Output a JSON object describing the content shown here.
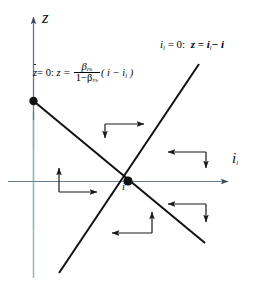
{
  "figure": {
    "type": "phase-plane-diagram",
    "background": "#ffffff"
  },
  "axes": {
    "vertical": {
      "label": "z",
      "name": "z-axis",
      "color_upper": "#c9525f",
      "color_lower": "#7fb0ad",
      "x": 33,
      "y_top": 12,
      "y_bottom": 278
    },
    "horizontal": {
      "label": "i",
      "label_subscript": "l",
      "name": "il-axis",
      "color": "#6e7f94",
      "y": 181,
      "x_left": 8,
      "x_right": 232
    }
  },
  "nullclines": [
    {
      "name": "zdot-nullcline",
      "slope": "negative",
      "label_prefix": "z",
      "label_prefix_condition": "= 0:",
      "label_lhs": "z =",
      "numerator": "β",
      "numerator_sub": "Pb",
      "denominator_lead": "1−β",
      "denominator_sub": "Pb",
      "factor": "( i − i",
      "factor_sub": "l",
      "factor_close": " )",
      "color": "#000000"
    },
    {
      "name": "ildot-nullcline",
      "slope": "positive",
      "label": "i",
      "label_sub": "l",
      "label_eq": "= 0:",
      "label_rhs_lead": "z = i",
      "label_rhs_sub": "l",
      "label_rhs_tail": "− i",
      "color": "#000000"
    }
  ],
  "points": [
    {
      "name": "equilibrium-point",
      "label": "i",
      "x": 128,
      "y": 181,
      "color": "#000000"
    },
    {
      "name": "z-axis-intercept-point",
      "label": "",
      "x": 33,
      "y": 101,
      "color": "#000000"
    }
  ],
  "flow_arrows": [
    {
      "name": "arrow-pair-upper-middle",
      "region": "upper-middle",
      "horizontal": "right",
      "vertical": "down"
    },
    {
      "name": "arrow-pair-upper-right",
      "region": "upper-right",
      "horizontal": "left",
      "vertical": "down"
    },
    {
      "name": "arrow-pair-left",
      "region": "left",
      "horizontal": "right",
      "vertical": "up"
    },
    {
      "name": "arrow-pair-lower-right",
      "region": "lower-right",
      "horizontal": "left",
      "vertical": "down"
    },
    {
      "name": "arrow-pair-lower-middle",
      "region": "lower-middle",
      "horizontal": "left",
      "vertical": "up"
    }
  ]
}
